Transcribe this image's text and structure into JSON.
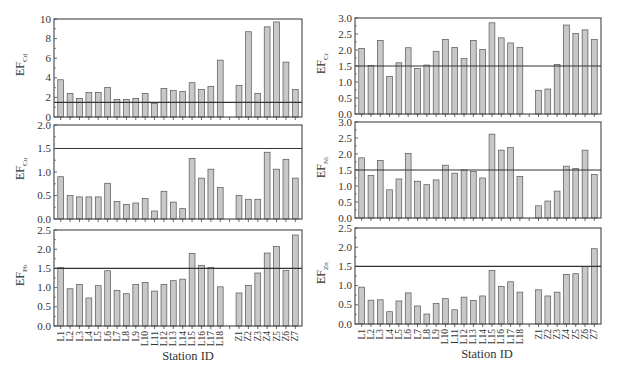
{
  "figure": {
    "x_axis_title": "Station ID",
    "threshold_line": 1.5,
    "bar_color": "#c8c8c8",
    "bar_edge_color": "#555555",
    "frame_color": "#444444"
  },
  "chart_data": [
    {
      "type": "bar",
      "panel": "top-left",
      "ylabel": "EF",
      "ylabel_sub": "Cd",
      "ylim": [
        0,
        10
      ],
      "yticks": [
        0,
        2,
        4,
        6,
        8,
        10
      ],
      "ytick_labels": [
        "0",
        "2",
        "4",
        "6",
        "8",
        "10"
      ],
      "threshold": 1.5,
      "categories": [
        "L1",
        "L2",
        "L3",
        "L4",
        "L5",
        "L6",
        "L7",
        "L8",
        "L9",
        "L10",
        "L11",
        "L12",
        "L13",
        "L14",
        "L15",
        "L16",
        "L17",
        "L18",
        "",
        "Z1",
        "Z2",
        "Z3",
        "Z4",
        "Z5",
        "Z6",
        "Z7"
      ],
      "values": [
        3.8,
        2.4,
        1.9,
        2.5,
        2.5,
        3.0,
        1.8,
        1.8,
        1.9,
        2.4,
        1.4,
        2.9,
        2.7,
        2.6,
        3.5,
        2.8,
        3.1,
        5.8,
        null,
        3.2,
        8.7,
        2.4,
        9.2,
        9.7,
        5.6,
        2.8
      ]
    },
    {
      "type": "bar",
      "panel": "top-right",
      "ylabel": "EF",
      "ylabel_sub": "Cr",
      "ylim": [
        0,
        3
      ],
      "yticks": [
        0,
        0.5,
        1,
        1.5,
        2,
        2.5,
        3
      ],
      "ytick_labels": [
        "0.0",
        "0.5",
        "1.0",
        "1.5",
        "2.0",
        "2.5",
        "3.0"
      ],
      "threshold": 1.5,
      "categories": [
        "L1",
        "L2",
        "L3",
        "L4",
        "L5",
        "L6",
        "L7",
        "L8",
        "L9",
        "L10",
        "L11",
        "L12",
        "L13",
        "L14",
        "L15",
        "L16",
        "L17",
        "L18",
        "",
        "Z1",
        "Z2",
        "Z3",
        "Z4",
        "Z5",
        "Z6",
        "Z7"
      ],
      "values": [
        2.05,
        1.52,
        2.3,
        1.17,
        1.6,
        2.07,
        1.42,
        1.53,
        1.96,
        2.33,
        2.08,
        1.73,
        2.3,
        2.02,
        2.85,
        2.38,
        2.22,
        2.08,
        null,
        0.74,
        0.78,
        1.55,
        2.78,
        2.52,
        2.63,
        2.33
      ]
    },
    {
      "type": "bar",
      "panel": "middle-left",
      "ylabel": "EF",
      "ylabel_sub": "Cu",
      "ylim": [
        0,
        2
      ],
      "yticks": [
        0,
        0.5,
        1,
        1.5,
        2
      ],
      "ytick_labels": [
        "0.0",
        "0.5",
        "1.0",
        "1.5",
        "2.0"
      ],
      "threshold": 1.5,
      "categories": [
        "L1",
        "L2",
        "L3",
        "L4",
        "L5",
        "L6",
        "L7",
        "L8",
        "L9",
        "L10",
        "L11",
        "L12",
        "L13",
        "L14",
        "L15",
        "L16",
        "L17",
        "L18",
        "",
        "Z1",
        "Z2",
        "Z3",
        "Z4",
        "Z5",
        "Z6",
        "Z7"
      ],
      "values": [
        0.9,
        0.5,
        0.47,
        0.47,
        0.47,
        0.76,
        0.37,
        0.31,
        0.34,
        0.44,
        0.17,
        0.59,
        0.36,
        0.22,
        1.29,
        0.87,
        1.06,
        0.67,
        null,
        0.5,
        0.42,
        0.42,
        1.42,
        1.06,
        1.27,
        0.87
      ]
    },
    {
      "type": "bar",
      "panel": "middle-right",
      "ylabel": "EF",
      "ylabel_sub": "Ni",
      "ylim": [
        0,
        3
      ],
      "yticks": [
        0,
        0.5,
        1,
        1.5,
        2,
        2.5,
        3
      ],
      "ytick_labels": [
        "0.0",
        "0.5",
        "1.0",
        "1.5",
        "2.0",
        "2.5",
        "3.0"
      ],
      "threshold": 1.5,
      "categories": [
        "L1",
        "L2",
        "L3",
        "L4",
        "L5",
        "L6",
        "L7",
        "L8",
        "L9",
        "L10",
        "L11",
        "L12",
        "L13",
        "L14",
        "L15",
        "L16",
        "L17",
        "L18",
        "",
        "Z1",
        "Z2",
        "Z3",
        "Z4",
        "Z5",
        "Z6",
        "Z7"
      ],
      "values": [
        1.88,
        1.33,
        1.8,
        0.88,
        1.22,
        2.02,
        1.15,
        1.04,
        1.19,
        1.65,
        1.4,
        1.5,
        1.45,
        1.25,
        2.62,
        2.12,
        2.2,
        1.3,
        null,
        0.38,
        0.53,
        0.84,
        1.62,
        1.55,
        2.12,
        1.36
      ]
    },
    {
      "type": "bar",
      "panel": "bottom-left",
      "ylabel": "EF",
      "ylabel_sub": "Pb",
      "ylim": [
        0,
        2.5
      ],
      "yticks": [
        0,
        0.5,
        1,
        1.5,
        2,
        2.5
      ],
      "ytick_labels": [
        "0.0",
        "0.5",
        "1.0",
        "1.5",
        "2.0",
        "2.5"
      ],
      "threshold": 1.5,
      "categories": [
        "L1",
        "L2",
        "L3",
        "L4",
        "L5",
        "L6",
        "L7",
        "L8",
        "L9",
        "L10",
        "L11",
        "L12",
        "L13",
        "L14",
        "L15",
        "L16",
        "L17",
        "L18",
        "",
        "Z1",
        "Z2",
        "Z3",
        "Z4",
        "Z5",
        "Z6",
        "Z7"
      ],
      "values": [
        1.52,
        0.97,
        1.08,
        0.73,
        1.05,
        1.44,
        0.93,
        0.84,
        1.08,
        1.13,
        0.91,
        1.08,
        1.18,
        1.22,
        1.89,
        1.58,
        1.52,
        1.02,
        null,
        0.86,
        1.06,
        1.38,
        1.9,
        2.07,
        1.45,
        2.37
      ]
    },
    {
      "type": "bar",
      "panel": "bottom-right",
      "ylabel": "EF",
      "ylabel_sub": "Zn",
      "ylim": [
        0,
        2.5
      ],
      "yticks": [
        0,
        0.5,
        1,
        1.5,
        2,
        2.5
      ],
      "ytick_labels": [
        "0.0",
        "0.5",
        "1.0",
        "1.5",
        "2.0",
        "2.5"
      ],
      "threshold": 1.5,
      "categories": [
        "L1",
        "L2",
        "L3",
        "L4",
        "L5",
        "L6",
        "L7",
        "L8",
        "L9",
        "L10",
        "L11",
        "L12",
        "L13",
        "L14",
        "L15",
        "L16",
        "L17",
        "L18",
        "",
        "Z1",
        "Z2",
        "Z3",
        "Z4",
        "Z5",
        "Z6",
        "Z7"
      ],
      "values": [
        0.96,
        0.62,
        0.63,
        0.32,
        0.6,
        0.81,
        0.47,
        0.26,
        0.53,
        0.66,
        0.37,
        0.7,
        0.61,
        0.73,
        1.39,
        0.98,
        1.1,
        0.83,
        null,
        0.89,
        0.73,
        0.83,
        1.29,
        1.31,
        1.5,
        1.96
      ]
    }
  ]
}
